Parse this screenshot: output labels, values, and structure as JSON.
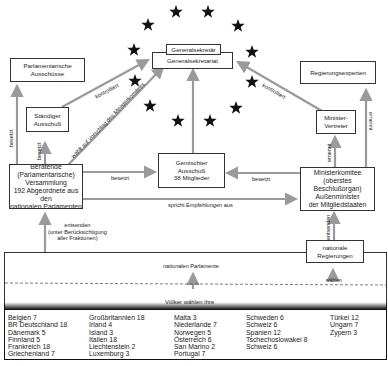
{
  "diagram": {
    "nodes": {
      "generalsekretaer": "Generalsekretär",
      "generalsekretariat": "Generalsekretariat",
      "parl_ausschuesse": [
        "Parlamentarische",
        "Ausschüsse"
      ],
      "staendiger_ausschuss": [
        "Ständiger",
        "Ausschuß"
      ],
      "regierungsexperten": "Regierungsexperten",
      "minister_vertreter": [
        "Minister-",
        "Vertreter"
      ],
      "beratende_versammlung": [
        "Beratende",
        "(Parlamentarische)",
        "Versammlung",
        "192 Abgeordnete aus den",
        "nationalen Parlamenten"
      ],
      "gemischter_ausschuss": [
        "Gemischter",
        "Ausschuß",
        "38 Mitglieder"
      ],
      "ministerkomitee": [
        "Ministerkomitee",
        "(oberstes Beschlußorgan)",
        "Außenminister",
        "der Mitgliedstaaten"
      ],
      "nationale_regierungen": [
        "nationale",
        "Regierungen"
      ],
      "nationale_parlamente": "nationalen Parlamente",
      "voelker": "Völker  wählen  ihre"
    },
    "edge_labels": {
      "kontrolliert_left": "kontrolliert",
      "kontrolliert_right": "kontrolliert",
      "waehlt": "wählt auf Vorschlag des Ministerkomitees",
      "besetzt_outer": "besetzt",
      "besetzt_inner": "besetzt",
      "besetzt_center_left": "besetzt",
      "besetzt_center_right": "besetzt",
      "spricht": "spricht Empfehlungen aus",
      "ernennt_inner": "ernennt",
      "ernennt_outer": "ernennt",
      "entsenden_left": [
        "entsenden",
        "(unter Berücksichtigung",
        "aller Fraktionen)"
      ],
      "entsenden_right": "entsenden",
      "waehlen": "wählen"
    },
    "stars_count": 12
  },
  "members_table": {
    "columns": [
      [
        "Belgien 7",
        "BR Deutschland 18",
        "Dänemark 5",
        "Finnland 5",
        "Frankreich 18",
        "Griechenland 7"
      ],
      [
        "Großbritannien 18",
        "Irland 4",
        "Island 3",
        "Italien 18",
        "Liechtenstein 2",
        "Luxemburg 3"
      ],
      [
        "Malta 3",
        "Niederlande 7",
        "Norwegen 5",
        "Österreich 6",
        "San Marino 2",
        "Portugal 7"
      ],
      [
        "Schweden 6",
        "Schweiz 6",
        "Spanien 12",
        "Tschechoslowakei 8",
        "Schweiz 6"
      ],
      [
        "Türkei 12",
        "Ungarn 7",
        "Zypern 3"
      ]
    ]
  },
  "colors": {
    "arrow": "#9a9a9a",
    "star": "#111111",
    "border": "#333333"
  }
}
